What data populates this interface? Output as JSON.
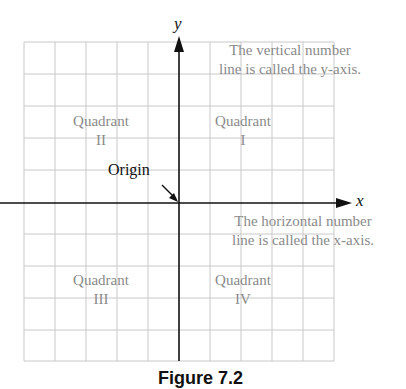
{
  "diagram": {
    "axis_labels": {
      "x": "x",
      "y": "y"
    },
    "origin_label": "Origin",
    "quadrants": [
      {
        "name": "Quadrant",
        "numeral": "I"
      },
      {
        "name": "Quadrant",
        "numeral": "II"
      },
      {
        "name": "Quadrant",
        "numeral": "III"
      },
      {
        "name": "Quadrant",
        "numeral": "IV"
      }
    ],
    "annotations": {
      "y_axis": {
        "line1": "The vertical number",
        "line2": "line is called the y-axis."
      },
      "x_axis": {
        "line1": "The horizontal number",
        "line2": "line is called the x-axis."
      }
    },
    "grid": {
      "columns": 10,
      "rows": 10
    },
    "caption": "Figure 7.2"
  }
}
